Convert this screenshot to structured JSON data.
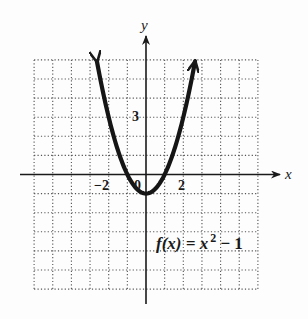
{
  "chart_data": {
    "type": "line",
    "title": "",
    "function": "f(x) = x^2 - 1",
    "annotation": "f(x) = x² − 1",
    "xlabel": "x",
    "ylabel": "y",
    "xlim": [
      -6,
      6
    ],
    "ylim": [
      -6,
      6
    ],
    "grid": true,
    "grid_style": "dotted",
    "tick_labels": {
      "x": [
        {
          "value": -2,
          "label": "−2"
        },
        {
          "value": 2,
          "label": "2"
        }
      ],
      "y": [
        {
          "value": 3,
          "label": "3"
        }
      ],
      "origin": "0"
    },
    "series": [
      {
        "name": "f(x) = x^2 - 1",
        "x": [
          -2.63,
          -2,
          -1.5,
          -1,
          -0.5,
          0,
          0.5,
          1,
          1.5,
          2,
          2.63
        ],
        "y": [
          5.92,
          3,
          1.25,
          0,
          -0.75,
          -1,
          -0.75,
          0,
          1.25,
          3,
          5.92
        ],
        "end_arrows": true
      }
    ],
    "vertex": {
      "x": 0,
      "y": -1
    },
    "x_intercepts": [
      -1,
      1
    ]
  },
  "labels": {
    "x_axis": "x",
    "y_axis": "y",
    "tick_neg2": "−2",
    "tick_pos2": "2",
    "tick_y3": "3",
    "origin": "0",
    "formula_f": "f",
    "formula_rest": "(x) = x",
    "formula_exp": "2",
    "formula_tail": " − 1"
  }
}
